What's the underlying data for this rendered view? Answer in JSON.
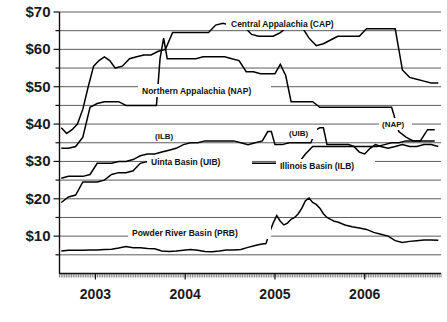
{
  "chart_data": {
    "type": "line",
    "title": "",
    "xlabel": "",
    "ylabel": "",
    "ylim": [
      0,
      70
    ],
    "xlim": [
      2002.6,
      2006.85
    ],
    "grid": true,
    "grid_interval": 5,
    "legend_position": "inline-annotations",
    "y_ticks": [
      "$10",
      "$20",
      "$30",
      "$40",
      "$50",
      "$60",
      "$70"
    ],
    "y_tick_values": [
      10,
      20,
      30,
      40,
      50,
      60,
      70
    ],
    "x_ticks": [
      "2003",
      "2004",
      "2005",
      "2006"
    ],
    "x_tick_values": [
      2003,
      2004,
      2005,
      2006
    ],
    "annotations": [
      {
        "text": "Central Appalachia (CAP)",
        "series": "CAP"
      },
      {
        "text": "Northern Appalachia (NAP)",
        "series": "NAP"
      },
      {
        "text": "(NAP)",
        "series": "NAP"
      },
      {
        "text": "(ILB)",
        "series": "ILB"
      },
      {
        "text": "Illinois Basin (ILB)",
        "series": "ILB"
      },
      {
        "text": "(UIB)",
        "series": "UIB"
      },
      {
        "text": "Uinta Basin (UIB)",
        "series": "UIB"
      },
      {
        "text": "Powder River Basin (PRB)",
        "series": "PRB"
      }
    ],
    "series": [
      {
        "name": "Central Appalachia (CAP)",
        "abbr": "CAP",
        "color": "#000000",
        "x": [
          2002.62,
          2002.68,
          2002.74,
          2002.8,
          2002.86,
          2002.92,
          2002.98,
          2003.04,
          2003.1,
          2003.16,
          2003.22,
          2003.3,
          2003.38,
          2003.46,
          2003.54,
          2003.62,
          2003.7,
          2003.78,
          2003.86,
          2003.94,
          2004.02,
          2004.1,
          2004.18,
          2004.26,
          2004.34,
          2004.42,
          2004.5,
          2004.58,
          2004.66,
          2004.74,
          2004.82,
          2004.9,
          2004.98,
          2005.06,
          2005.14,
          2005.22,
          2005.3,
          2005.38,
          2005.46,
          2005.54,
          2005.62,
          2005.7,
          2005.78,
          2005.86,
          2005.94,
          2006.02,
          2006.1,
          2006.18,
          2006.26,
          2006.34,
          2006.42,
          2006.5,
          2006.58,
          2006.66,
          2006.74,
          2006.82
        ],
        "y": [
          39.0,
          37.5,
          38.5,
          40.0,
          44.0,
          50.0,
          55.5,
          57.0,
          58.0,
          57.0,
          55.0,
          55.5,
          57.5,
          58.0,
          58.5,
          58.5,
          59.5,
          60.0,
          64.5,
          64.5,
          64.5,
          64.5,
          64.5,
          64.5,
          66.5,
          67.0,
          66.5,
          67.0,
          66.0,
          64.0,
          63.5,
          63.5,
          63.5,
          64.5,
          66.0,
          66.5,
          66.0,
          63.0,
          61.0,
          61.5,
          62.5,
          63.5,
          63.5,
          63.5,
          63.5,
          65.5,
          65.5,
          65.5,
          65.5,
          65.5,
          54.5,
          52.5,
          52.0,
          51.5,
          51.0,
          51.0
        ]
      },
      {
        "name": "Northern Appalachia (NAP)",
        "abbr": "NAP",
        "color": "#000000",
        "x": [
          2002.62,
          2002.7,
          2002.78,
          2002.86,
          2002.94,
          2003.02,
          2003.1,
          2003.18,
          2003.26,
          2003.34,
          2003.42,
          2003.5,
          2003.58,
          2003.64,
          2003.68,
          2003.72,
          2003.76,
          2003.8,
          2003.84,
          2003.88,
          2003.96,
          2004.04,
          2004.12,
          2004.2,
          2004.28,
          2004.36,
          2004.44,
          2004.52,
          2004.6,
          2004.68,
          2004.76,
          2004.84,
          2004.92,
          2005.0,
          2005.06,
          2005.12,
          2005.18,
          2005.26,
          2005.34,
          2005.42,
          2005.5,
          2005.58,
          2005.66,
          2005.74,
          2005.82,
          2005.9,
          2005.98,
          2006.06,
          2006.14,
          2006.22,
          2006.3,
          2006.38,
          2006.46,
          2006.54,
          2006.62,
          2006.7,
          2006.78
        ],
        "y": [
          33.5,
          33.5,
          34.0,
          36.5,
          44.5,
          45.5,
          46.0,
          46.0,
          46.0,
          45.0,
          45.0,
          45.0,
          45.0,
          45.0,
          45.0,
          57.5,
          63.0,
          57.5,
          57.5,
          57.5,
          57.5,
          57.5,
          57.5,
          58.0,
          58.0,
          58.0,
          58.0,
          57.5,
          57.0,
          54.0,
          54.0,
          53.5,
          53.5,
          53.5,
          56.0,
          53.0,
          46.0,
          46.0,
          46.0,
          46.0,
          44.5,
          44.5,
          44.5,
          44.5,
          44.5,
          44.5,
          44.5,
          44.5,
          44.5,
          44.5,
          44.5,
          38.0,
          36.5,
          35.5,
          35.5,
          38.5,
          38.5
        ]
      },
      {
        "name": "Illinois Basin (ILB)",
        "abbr": "ILB",
        "color": "#000000",
        "x": [
          2002.62,
          2002.7,
          2002.78,
          2002.86,
          2002.94,
          2003.02,
          2003.1,
          2003.18,
          2003.26,
          2003.34,
          2003.42,
          2003.5,
          2003.58,
          2003.66,
          2003.74,
          2003.82,
          2003.9,
          2003.98,
          2004.06,
          2004.14,
          2004.22,
          2004.3,
          2004.38,
          2004.46,
          2004.54,
          2004.62,
          2004.7,
          2004.78,
          2004.86,
          2004.92,
          2004.96,
          2005.0,
          2005.04,
          2005.08,
          2005.16,
          2005.24,
          2005.32,
          2005.4,
          2005.46,
          2005.5,
          2005.54,
          2005.58,
          2005.62,
          2005.66,
          2005.7,
          2005.76,
          2005.82,
          2005.88,
          2005.94,
          2006.0,
          2006.06,
          2006.12,
          2006.18,
          2006.26,
          2006.34,
          2006.42,
          2006.5,
          2006.58,
          2006.66,
          2006.74,
          2006.82
        ],
        "y": [
          25.5,
          26.0,
          26.0,
          26.0,
          26.5,
          29.5,
          29.5,
          29.5,
          30.0,
          30.0,
          30.5,
          31.5,
          32.0,
          32.0,
          32.5,
          33.0,
          33.5,
          34.5,
          35.0,
          35.0,
          35.5,
          35.5,
          35.5,
          35.5,
          35.5,
          35.0,
          34.5,
          35.0,
          35.5,
          38.0,
          38.0,
          34.5,
          34.5,
          34.5,
          35.0,
          35.0,
          35.0,
          35.0,
          38.5,
          39.0,
          39.0,
          34.5,
          34.5,
          34.5,
          34.5,
          34.5,
          34.5,
          34.0,
          32.5,
          32.0,
          33.5,
          34.5,
          34.0,
          33.5,
          34.0,
          34.5,
          34.0,
          34.0,
          34.5,
          34.5,
          34.0
        ]
      },
      {
        "name": "Uinta Basin (UIB)",
        "abbr": "UIB",
        "color": "#000000",
        "x": [
          2002.62,
          2002.7,
          2002.78,
          2002.86,
          2002.94,
          2003.02,
          2003.1,
          2003.18,
          2003.26,
          2003.34,
          2003.42,
          2003.5,
          2003.58,
          2003.66,
          2003.74,
          2003.82,
          2003.9,
          2003.98,
          2004.06,
          2004.14,
          2004.22,
          2004.3,
          2004.38,
          2004.46,
          2004.54,
          2004.62,
          2004.7,
          2004.78,
          2004.86,
          2004.94,
          2005.02,
          2005.1,
          2005.18,
          2005.26,
          2005.34,
          2005.42,
          2005.5,
          2005.58,
          2005.66,
          2005.74,
          2005.82,
          2005.9,
          2005.98,
          2006.06,
          2006.14,
          2006.22,
          2006.3,
          2006.38,
          2006.46,
          2006.54,
          2006.62,
          2006.7,
          2006.78
        ],
        "y": [
          19.0,
          20.5,
          21.0,
          24.5,
          24.5,
          24.5,
          25.0,
          26.5,
          27.0,
          27.0,
          27.5,
          29.5,
          30.0,
          30.0,
          30.0,
          30.0,
          30.0,
          30.0,
          30.0,
          30.0,
          29.5,
          29.5,
          29.5,
          29.5,
          29.5,
          29.5,
          29.5,
          29.5,
          29.5,
          29.5,
          29.5,
          29.5,
          29.5,
          29.5,
          32.0,
          34.0,
          34.0,
          34.0,
          34.0,
          34.0,
          34.0,
          34.0,
          34.0,
          34.0,
          34.0,
          34.5,
          35.0,
          35.0,
          35.5,
          35.5,
          35.5,
          35.5,
          35.5
        ]
      },
      {
        "name": "Powder River Basin (PRB)",
        "abbr": "PRB",
        "color": "#000000",
        "x": [
          2002.62,
          2002.7,
          2002.78,
          2002.86,
          2002.94,
          2003.02,
          2003.1,
          2003.18,
          2003.26,
          2003.34,
          2003.42,
          2003.5,
          2003.58,
          2003.66,
          2003.74,
          2003.82,
          2003.9,
          2003.98,
          2004.06,
          2004.14,
          2004.22,
          2004.3,
          2004.38,
          2004.46,
          2004.54,
          2004.62,
          2004.7,
          2004.78,
          2004.84,
          2004.9,
          2004.94,
          2004.98,
          2005.02,
          2005.06,
          2005.1,
          2005.14,
          2005.18,
          2005.22,
          2005.26,
          2005.3,
          2005.34,
          2005.38,
          2005.42,
          2005.46,
          2005.5,
          2005.54,
          2005.58,
          2005.62,
          2005.66,
          2005.7,
          2005.78,
          2005.86,
          2005.94,
          2006.02,
          2006.1,
          2006.18,
          2006.26,
          2006.34,
          2006.42,
          2006.5,
          2006.58,
          2006.66,
          2006.74,
          2006.82
        ],
        "y": [
          6.0,
          6.2,
          6.2,
          6.2,
          6.3,
          6.3,
          6.4,
          6.5,
          6.8,
          7.2,
          6.9,
          6.9,
          6.7,
          6.6,
          6.0,
          5.9,
          6.0,
          6.2,
          6.4,
          6.2,
          5.9,
          5.8,
          6.0,
          6.3,
          6.3,
          6.4,
          7.0,
          7.5,
          7.8,
          8.0,
          11.0,
          13.5,
          15.5,
          14.0,
          13.0,
          13.5,
          14.5,
          15.0,
          16.0,
          17.5,
          19.5,
          20.2,
          19.0,
          18.5,
          17.5,
          16.0,
          15.0,
          14.5,
          14.0,
          13.8,
          13.0,
          12.5,
          12.2,
          11.8,
          11.0,
          10.5,
          10.0,
          8.8,
          8.3,
          8.6,
          8.8,
          9.0,
          9.0,
          8.9
        ]
      }
    ]
  }
}
